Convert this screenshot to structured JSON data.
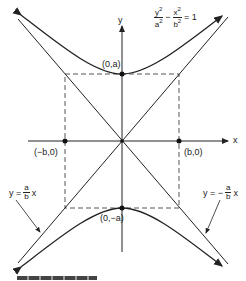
{
  "diagram": {
    "type": "hyperbola",
    "equation": {
      "lhs_num1": "y",
      "lhs_den1": "a",
      "lhs_num2": "x",
      "lhs_den2": "b",
      "exp": "2",
      "minus": "−",
      "rhs": "= 1"
    },
    "axes": {
      "x_label": "x",
      "y_label": "y"
    },
    "points": {
      "top_vertex": "(0,a)",
      "bottom_vertex": "(0,−a)",
      "left_co_vertex": "(−b,0)",
      "right_co_vertex": "(b,0)"
    },
    "asymptotes": {
      "left": {
        "prefix": "y =",
        "num": "a",
        "den": "b",
        "suffix": "x"
      },
      "right": {
        "prefix": "y = −",
        "num": "a",
        "den": "b",
        "suffix": "x"
      }
    },
    "colors": {
      "stroke": "#222222",
      "background": "#ffffff"
    }
  }
}
